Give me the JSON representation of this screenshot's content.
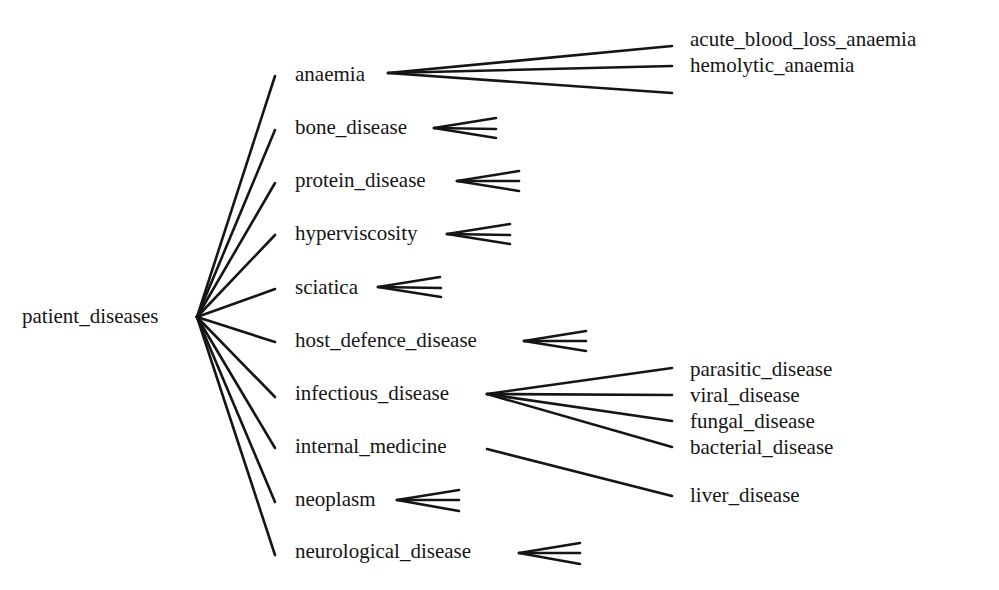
{
  "diagram": {
    "type": "tree",
    "root": "patient_diseases",
    "children": [
      {
        "label": "anaemia",
        "collapsed": false,
        "children": [
          "acute_blood_loss_anaemia",
          "hemolytic_anaemia",
          ""
        ]
      },
      {
        "label": "bone_disease",
        "collapsed": true
      },
      {
        "label": "protein_disease",
        "collapsed": true
      },
      {
        "label": "hyperviscosity",
        "collapsed": true
      },
      {
        "label": "sciatica",
        "collapsed": true
      },
      {
        "label": "host_defence_disease",
        "collapsed": true
      },
      {
        "label": "infectious_disease",
        "collapsed": false,
        "children": [
          "parasitic_disease",
          "viral_disease",
          "fungal_disease",
          "bacterial_disease"
        ]
      },
      {
        "label": "internal_medicine",
        "collapsed": false,
        "children": [
          "liver_disease"
        ]
      },
      {
        "label": "neoplasm",
        "collapsed": true
      },
      {
        "label": "neurological_disease",
        "collapsed": true
      }
    ]
  },
  "labels": {
    "root": "patient_diseases",
    "anaemia": "anaemia",
    "bone_disease": "bone_disease",
    "protein_disease": "protein_disease",
    "hyperviscosity": "hyperviscosity",
    "sciatica": "sciatica",
    "host_defence_disease": "host_defence_disease",
    "infectious_disease": "infectious_disease",
    "internal_medicine": "internal_medicine",
    "neoplasm": "neoplasm",
    "neurological_disease": "neurological_disease",
    "acute_blood_loss_anaemia": "acute_blood_loss_anaemia",
    "hemolytic_anaemia": "hemolytic_anaemia",
    "parasitic_disease": "parasitic_disease",
    "viral_disease": "viral_disease",
    "fungal_disease": "fungal_disease",
    "bacterial_disease": "bacterial_disease",
    "liver_disease": "liver_disease"
  },
  "colors": {
    "ink": "#151515",
    "background": "#ffffff"
  }
}
